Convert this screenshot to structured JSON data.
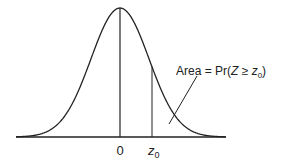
{
  "chart_data": {
    "type": "line",
    "title": "",
    "xlabel": "",
    "ylabel": "",
    "x_tick_labels": [
      "0",
      "z0"
    ],
    "annotation": "Area = Pr(Z ≥ z0)",
    "series": [
      {
        "name": "standard normal pdf",
        "mean": 0,
        "sd": 1
      }
    ],
    "vertical_lines": [
      {
        "x": 0,
        "label": "0"
      },
      {
        "x": 0.55,
        "label": "z0"
      }
    ],
    "grid": false,
    "legend": "none"
  },
  "labels": {
    "zero": "0",
    "z": "z",
    "z_sub": "0",
    "area_prefix": "Area = Pr(",
    "area_Z": "Z",
    "area_ge": " ≥ ",
    "area_z": "z",
    "area_sub": "0",
    "area_suffix": ")"
  },
  "colors": {
    "ink": "#222222",
    "background": "#ffffff"
  }
}
